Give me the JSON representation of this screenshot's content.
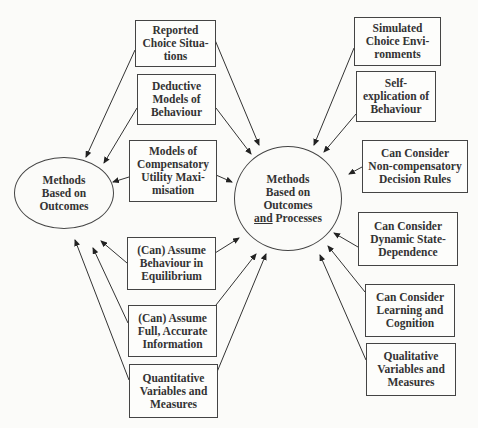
{
  "diagram": {
    "nodes": {
      "outcomes": {
        "lines": [
          "Methods",
          "Based on",
          "Outcomes"
        ]
      },
      "outcomes_processes": {
        "lines": [
          "Methods",
          "Based on",
          "Outcomes"
        ],
        "last_line_underlined": "and",
        "last_line_rest": " Processes"
      }
    },
    "left_boxes": [
      {
        "id": "reported",
        "lines": [
          "Reported",
          "Choice Situa-",
          "tions"
        ]
      },
      {
        "id": "deductive",
        "lines": [
          "Deductive",
          "Models of",
          "Behaviour"
        ]
      },
      {
        "id": "compensatory",
        "lines": [
          "Models of",
          "Compensatory",
          "Utility Maxi-",
          "misation"
        ]
      },
      {
        "id": "equilibrium",
        "lines": [
          "(Can) Assume",
          "Behaviour in",
          "Equilibrium"
        ]
      },
      {
        "id": "full_info",
        "lines": [
          "(Can) Assume",
          "Full, Accurate",
          "Information"
        ]
      },
      {
        "id": "quantitative",
        "lines": [
          "Quantitative",
          "Variables and",
          "Measures"
        ]
      }
    ],
    "right_boxes": [
      {
        "id": "simulated",
        "lines": [
          "Simulated",
          "Choice Envi-",
          "ronments"
        ]
      },
      {
        "id": "self_explication",
        "lines": [
          "Self-",
          "explication of",
          "Behaviour"
        ]
      },
      {
        "id": "non_compensatory",
        "lines": [
          "Can Consider",
          "Non-compensatory",
          "Decision Rules"
        ]
      },
      {
        "id": "dynamic",
        "lines": [
          "Can Consider",
          "Dynamic State-",
          "Dependence"
        ]
      },
      {
        "id": "learning",
        "lines": [
          "Can Consider",
          "Learning and",
          "Cognition"
        ]
      },
      {
        "id": "qualitative",
        "lines": [
          "Qualitative",
          "Variables and",
          "Measures"
        ]
      }
    ],
    "colors": {
      "line": "#333333",
      "background": "#fbfbf9"
    }
  }
}
